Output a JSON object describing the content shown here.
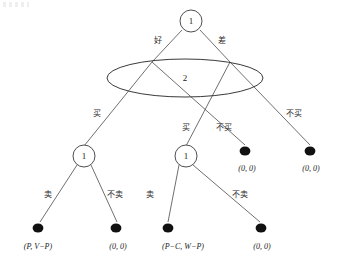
{
  "diagram": {
    "type": "extensive-form-game-tree",
    "title": "",
    "nodes": [
      {
        "id": "root",
        "label": "1",
        "kind": "decision-circle",
        "x": 191,
        "y": 21,
        "r": 11
      },
      {
        "id": "infoset",
        "label": "2",
        "kind": "information-set-ellipse",
        "x": 185,
        "y": 78,
        "rx": 78,
        "ry": 19
      },
      {
        "id": "d1",
        "label": "1",
        "kind": "decision-circle",
        "x": 84,
        "y": 156,
        "r": 11
      },
      {
        "id": "d2",
        "label": "1",
        "kind": "decision-circle",
        "x": 186,
        "y": 156,
        "r": 11
      }
    ],
    "terminals": [
      {
        "id": "t1",
        "payoff": "(P, V−P)",
        "x": 38,
        "y": 228,
        "label_x": 38,
        "label_y": 246
      },
      {
        "id": "t2",
        "payoff": "(0, 0)",
        "x": 116,
        "y": 228,
        "label_x": 118,
        "label_y": 246
      },
      {
        "id": "t3",
        "payoff": "(P−C, W−P)",
        "x": 168,
        "y": 228,
        "label_x": 183,
        "label_y": 246
      },
      {
        "id": "t4",
        "payoff": "(0, 0)",
        "x": 261,
        "y": 228,
        "label_x": 262,
        "label_y": 246
      },
      {
        "id": "t5",
        "payoff": "(0, 0)",
        "x": 245,
        "y": 151,
        "label_x": 247,
        "label_y": 168
      },
      {
        "id": "t6",
        "payoff": "(0, 0)",
        "x": 310,
        "y": 151,
        "label_x": 311,
        "label_y": 168
      }
    ],
    "edges": [
      {
        "id": "e-good",
        "label": "好",
        "x1": 182,
        "y1": 30,
        "x2": 152,
        "y2": 62,
        "label_x": 158,
        "label_y": 40
      },
      {
        "id": "e-bad",
        "label": "差",
        "x1": 200,
        "y1": 30,
        "x2": 230,
        "y2": 62,
        "label_x": 222,
        "label_y": 40
      },
      {
        "id": "e-buy-left",
        "label": "买",
        "x1": 152,
        "y1": 62,
        "x2": 84,
        "y2": 146,
        "label_x": 97,
        "label_y": 113
      },
      {
        "id": "e-nobuy-left",
        "label": "不买",
        "x1": 152,
        "y1": 62,
        "x2": 245,
        "y2": 145,
        "label_x": 224,
        "label_y": 127
      },
      {
        "id": "e-buy-right",
        "label": "买",
        "x1": 230,
        "y1": 62,
        "x2": 186,
        "y2": 146,
        "label_x": 186,
        "label_y": 127
      },
      {
        "id": "e-nobuy-right",
        "label": "不买",
        "x1": 230,
        "y1": 62,
        "x2": 310,
        "y2": 145,
        "label_x": 294,
        "label_y": 113
      },
      {
        "id": "e-sell-1",
        "label": "卖",
        "x1": 77,
        "y1": 165,
        "x2": 40,
        "y2": 222,
        "label_x": 48,
        "label_y": 194
      },
      {
        "id": "e-nosell-1",
        "label": "不卖",
        "x1": 91,
        "y1": 165,
        "x2": 117,
        "y2": 222,
        "label_x": 115,
        "label_y": 194
      },
      {
        "id": "e-sell-2",
        "label": "卖",
        "x1": 179,
        "y1": 165,
        "x2": 168,
        "y2": 222,
        "label_x": 150,
        "label_y": 194
      },
      {
        "id": "e-nosell-2",
        "label": "不卖",
        "x1": 193,
        "y1": 165,
        "x2": 260,
        "y2": 222,
        "label_x": 240,
        "label_y": 194
      }
    ],
    "colors": {
      "edge": "#4a4a4a",
      "node_stroke": "#3a3a3a",
      "terminal_fill": "#111111",
      "background": "#ffffff",
      "text": "#1a1a1a"
    }
  }
}
